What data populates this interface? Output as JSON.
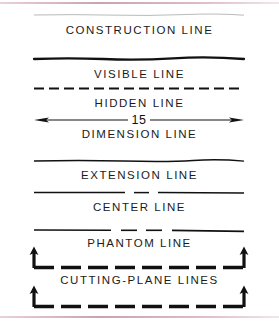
{
  "document": {
    "kind": "technical-drawing-reference",
    "title": "Alphabet of Lines",
    "background_color": "#ffffff",
    "ink_color": "#1b1b1b",
    "scan_edge_color": "#c79ead"
  },
  "rows": [
    {
      "id": "construction-line",
      "label": "CONSTRUCTION LINE",
      "line_style": "very-light-continuous-thin",
      "weight": 0.7,
      "opacity": 0.42,
      "dash": "none"
    },
    {
      "id": "visible-line",
      "label": "VISIBLE LINE",
      "line_style": "continuous-thick",
      "weight": 2.2,
      "opacity": 1,
      "dash": "none"
    },
    {
      "id": "hidden-line",
      "label": "HIDDEN LINE",
      "line_style": "short-dashed-medium",
      "weight": 1.9,
      "opacity": 1,
      "dash": "10 5"
    },
    {
      "id": "dimension-line",
      "label": "DIMENSION LINE",
      "line_style": "continuous-thin-with-arrowheads",
      "weight": 1.0,
      "opacity": 1,
      "dash": "none",
      "arrowheads": "both-ends",
      "dimension_value": "15"
    },
    {
      "id": "extension-line",
      "label": "EXTENSION LINE",
      "line_style": "continuous-thin",
      "weight": 1.3,
      "opacity": 1,
      "dash": "none"
    },
    {
      "id": "center-line",
      "label": "CENTER LINE",
      "line_style": "long-short-long-chain-thin",
      "weight": 1.3,
      "opacity": 1,
      "dash": "long-short"
    },
    {
      "id": "phantom-line",
      "label": "PHANTOM LINE",
      "line_style": "long-short-short-long-chain-thin",
      "weight": 1.4,
      "opacity": 1,
      "dash": "long-short-short"
    },
    {
      "id": "cutting-plane-lines",
      "label": "CUTTING-PLANE LINES",
      "line_style": "heavy-dashed-with-end-arrows",
      "weight": 3.4,
      "opacity": 1,
      "dash": "14 7",
      "arrowheads": "both-ends-upward"
    }
  ]
}
